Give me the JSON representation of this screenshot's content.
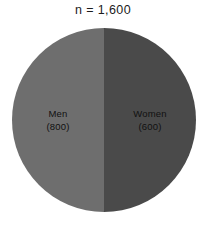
{
  "chart_data": {
    "type": "pie",
    "title": "n = 1,600",
    "xlabel": "",
    "ylabel": "",
    "categories": [
      "Men",
      "Women"
    ],
    "values": [
      800,
      600
    ],
    "value_labels": [
      "(800)",
      "(600)"
    ],
    "slice_fractions": [
      0.5,
      0.5
    ],
    "colors": [
      "#6e6e6e",
      "#4a4a4a"
    ],
    "legend": "none",
    "grid": false,
    "background": "#ffffff",
    "slices": [
      {
        "name": "Men",
        "value": 800,
        "value_label": "(800)",
        "color": "#6e6e6e",
        "side": "left"
      },
      {
        "name": "Women",
        "value": 600,
        "value_label": "(600)",
        "color": "#4a4a4a",
        "side": "right"
      }
    ]
  }
}
